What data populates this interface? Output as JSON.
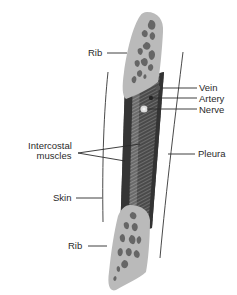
{
  "diagram": {
    "colors": {
      "background": "#ffffff",
      "bone_cortex": "#b9b9b9",
      "bone_marrow_spots": "#6a6a6a",
      "muscle_dark": "#3e3e3e",
      "muscle_mid": "#5c5c5c",
      "muscle_light": "#8a8a8a",
      "leader_line": "#2a2a2a",
      "membrane_line": "#4a4a4a",
      "nerve": "#d9d9d9",
      "artery": "#2b2b2b",
      "vein": "#505050",
      "text": "#2a2a2a"
    },
    "labels": {
      "rib_top": "Rib",
      "vein": "Vein",
      "artery": "Artery",
      "nerve": "Nerve",
      "intercostal_line1": "Intercostal",
      "intercostal_line2": "muscles",
      "pleura": "Pleura",
      "skin": "Skin",
      "rib_bottom": "Rib"
    },
    "structures": [
      {
        "name": "Rib",
        "position": "upper",
        "type": "bone"
      },
      {
        "name": "Vein",
        "type": "vessel"
      },
      {
        "name": "Artery",
        "type": "vessel"
      },
      {
        "name": "Nerve",
        "type": "nerve"
      },
      {
        "name": "Intercostal muscles",
        "type": "muscle"
      },
      {
        "name": "Pleura",
        "type": "membrane"
      },
      {
        "name": "Skin",
        "type": "membrane"
      },
      {
        "name": "Rib",
        "position": "lower",
        "type": "bone"
      }
    ]
  }
}
